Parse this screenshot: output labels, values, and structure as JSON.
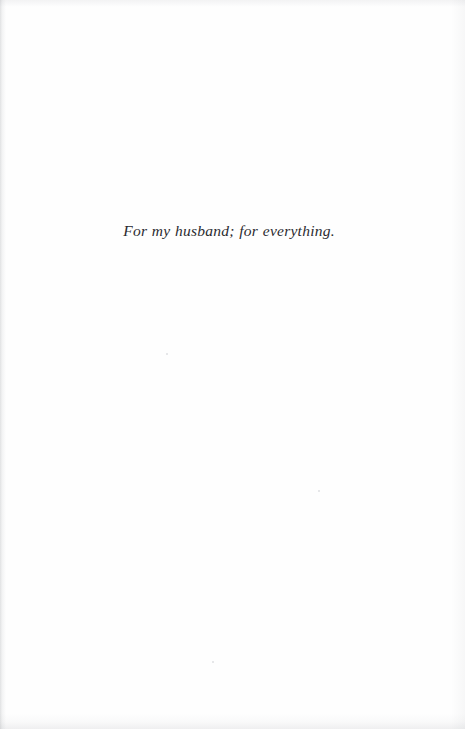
{
  "page": {
    "kind": "book-dedication-page",
    "background_color": "#fefefe",
    "ink_color": "#2b2b30",
    "width": 465,
    "height": 729
  },
  "dedication": {
    "text": "For my husband; for everything.",
    "style": "italic serif",
    "alignment": "center"
  }
}
